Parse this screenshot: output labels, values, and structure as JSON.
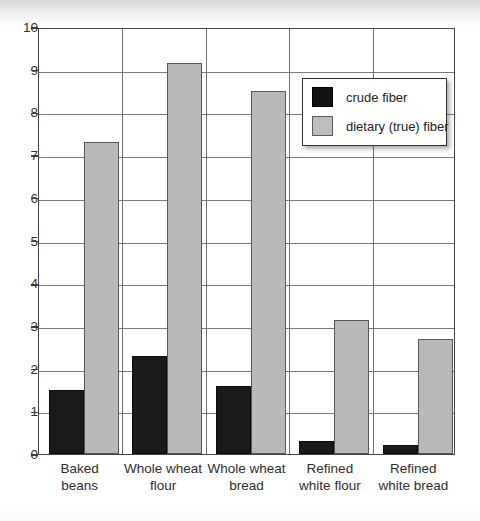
{
  "chart_data": {
    "type": "bar",
    "title": "",
    "xlabel": "",
    "ylabel": "",
    "ylim": [
      0,
      10
    ],
    "ytick_step": 1,
    "yticks": [
      "10",
      "9",
      "8",
      "7",
      "6",
      "5",
      "4",
      "3",
      "2",
      "1",
      "0"
    ],
    "grid": "horizontal-and-vertical",
    "legend_position": "upper-right",
    "categories": [
      "Baked beans",
      "Whole wheat flour",
      "Whole wheat bread",
      "Refined white flour",
      "Refined white bread"
    ],
    "category_lines": [
      [
        "Baked",
        "beans"
      ],
      [
        "Whole wheat",
        "flour"
      ],
      [
        "Whole wheat",
        "bread"
      ],
      [
        "Refined",
        "white flour"
      ],
      [
        "Refined",
        "white bread"
      ]
    ],
    "series": [
      {
        "name": "crude fiber",
        "color": "#1a1a1a",
        "values": [
          1.5,
          2.3,
          1.6,
          0.3,
          0.2
        ]
      },
      {
        "name": "dietary (true) fiber",
        "color": "#b9b9b9",
        "values": [
          7.3,
          9.15,
          8.5,
          3.15,
          2.7
        ]
      }
    ]
  },
  "legend": {
    "items": [
      {
        "label": "crude fiber",
        "swatch": "crude"
      },
      {
        "label": "dietary (true) fiber",
        "swatch": "dietary"
      }
    ]
  },
  "caption": ""
}
